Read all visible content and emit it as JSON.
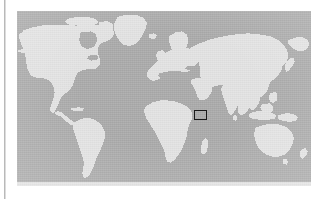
{
  "figure": {
    "kind": "locator-map",
    "caption": ""
  },
  "margin_rule": {
    "present": true,
    "color": "#b9b9b9"
  },
  "map": {
    "projection": "equirectangular",
    "lon_range": [
      -180,
      180
    ],
    "lat_range": [
      -90,
      90
    ],
    "ocean_color": "#a9a9a9",
    "land_color": "#e2e2e2",
    "border_color": "#a9a9a9",
    "graticule": "none",
    "labels": "none",
    "continents": [
      "North America",
      "South America",
      "Greenland",
      "Europe",
      "Africa",
      "Asia",
      "Australia",
      "Antarctica (cropped)"
    ]
  },
  "annotation": {
    "type": "study-area-rectangle",
    "label": "",
    "stroke_color": "#1a1a1a",
    "fill": "none",
    "stroke_width_px": 1.6,
    "approx_lon_range": [
      38,
      55
    ],
    "approx_lat_range": [
      6,
      20
    ],
    "region_hint": "Horn of Africa / Gulf of Aden / Arabian Peninsula"
  },
  "geometry": {
    "land_paths": [
      "M 29.5 8 L 41 6.6 L 53 7.2 L 63 9.4 L 70 12.5 L 74.5 16 L 72 19 L 64 20.5 L 56 21.2 L 48.5 22.6 L 41.5 25 L 36 28.4 L 33 32 L 32.6 36 L 35 39.2 L 39.5 41 L 45 41.4 L 51 40.4 L 56.5 38.6 L 61 36.4 L 66.5 35 L 72 34.8 L 77 36 L 80.5 38.4 L 82 41.6 L 81 45.2 L 78 48.4 L 74 51 L 71.5 54 L 71 57.4 L 72.5 60.6 L 76 62.6 L 80 63.4 L 84 63 L 87.5 61.6 L 90.5 59.6 L 92.5 57 L 93.5 54 L 93 51 L 91 48.4 L 88.5 46.4 L 87 44 L 87.4 41 L 89.5 38.6 L 93 37.2 L 97 37 L 100.5 38.2 L 103 40.6 L 104 44 L 103.4 47.6 L 101.5 51 L 99 54 L 97 57 L 96 60.4 L 96.4 64 L 98 67 L 100.5 69 L 104 70 L 107.5 69.8 L 110.5 68.6 L 112.5 66.4 L 113.5 63.6 L 113 60.6 L 111 58 L 109 55.6 L 108.4 52.6 L 109.5 49.6 L 112 47.6 L 115.5 46.8 L 119 47.2 L 122 48.8 L 124 51.4 L 124.6 54.6 L 123.8 58 L 121.8 61 L 119 63.4 L 116.4 66 L 115 69 L 115.4 72.4 L 117.4 75 L 120.4 76.4 L 124 76.6 L 127.4 75.6 L 130 73.6 L 131.4 70.8 L 131.4 67.6 L 130 64.8 L 128 62.4 L 127 59.6 L 127.6 56.6 L 130 54.6 L 133.4 54 L 137 54.6 L 140 56.4 L 142 59 L 143 62.2 L 142.6 65.6 L 141 68.8 L 138.6 71.6 L 136.6 74.6 L 135.6 78 L 136 81.4 L 138 84 L 141 85.4 L 144.4 85.6 L 147.6 84.6 L 150 82.6 L 151.4 79.8 L 151.4 76.6 L 150 73.8 L 148 71.4 L 147 68.6 L 147.6 65.6 L 150 63.6 L 153.4 63 L 157 63.6 L 160 65.4 L 162 68 L 163 71.2 L 162.6 74.6 L 161 77.8 L 158.6 80.6 L 156.6 83.6 L 155.6 87 L 156 90.4 L 158 93 L 161 94.4 L 164.4 94.6 L 167.6 93.6 L 170 91.6 L 171.4 88.8 L 171.4 85.6 L 170 82.8 L 168 80.4 L 167 77.6 L 167.6 74.6 L 170 72.6 L 173.4 72 L 177 72.6 L 180 74.4 L 182 77 L 183 80.2 Z",
      "M 0 0 L 0 0 Z"
    ]
  }
}
